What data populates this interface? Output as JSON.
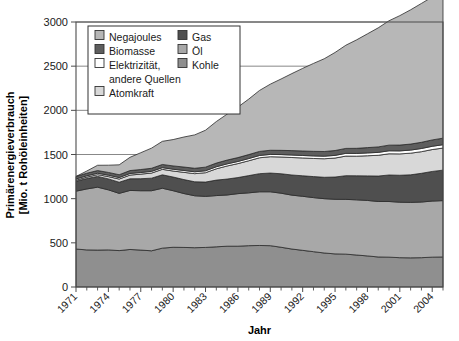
{
  "chart_data": {
    "type": "area",
    "stacked": true,
    "title": "",
    "xlabel": "Jahr",
    "ylabel": "Primärenergieverbrauch [Mio. t Rohöleinheiten]",
    "ylabel_line1": "Primärenergieverbrauch",
    "ylabel_line2": "[Mio. t Rohöleinheiten]",
    "ylim": [
      0,
      3000
    ],
    "ytick_values": [
      0,
      500,
      1000,
      1500,
      2000,
      2500,
      3000
    ],
    "ytick_labels": [
      "0",
      "500",
      "1000",
      "1500",
      "2000",
      "2500",
      "3000"
    ],
    "grid": "horizontal-major",
    "legend_position": "top-left-inside",
    "x": [
      1971,
      1972,
      1973,
      1974,
      1975,
      1976,
      1977,
      1978,
      1979,
      1980,
      1981,
      1982,
      1983,
      1984,
      1985,
      1986,
      1987,
      1988,
      1989,
      1990,
      1991,
      1992,
      1993,
      1994,
      1995,
      1996,
      1997,
      1998,
      1999,
      2000,
      2001,
      2002,
      2003,
      2004,
      2005
    ],
    "xtick_labels": [
      "1971",
      "1974",
      "1977",
      "1980",
      "1983",
      "1986",
      "1989",
      "1992",
      "1995",
      "1998",
      "2001",
      "2004"
    ],
    "xtick_values": [
      1971,
      1974,
      1977,
      1980,
      1983,
      1986,
      1989,
      1992,
      1995,
      1998,
      2001,
      2004
    ],
    "xlim": [
      1971,
      2005
    ],
    "series": [
      {
        "name": "Kohle",
        "color": "#8f8f8f",
        "values": [
          430,
          420,
          418,
          420,
          412,
          425,
          418,
          410,
          440,
          450,
          448,
          445,
          448,
          455,
          462,
          462,
          468,
          470,
          468,
          450,
          430,
          415,
          400,
          385,
          375,
          372,
          362,
          352,
          340,
          338,
          332,
          330,
          332,
          338,
          340
        ]
      },
      {
        "name": "Öl",
        "color": "#a8a8a8",
        "values": [
          655,
          690,
          712,
          680,
          648,
          668,
          672,
          680,
          678,
          640,
          610,
          588,
          578,
          580,
          580,
          595,
          598,
          608,
          610,
          612,
          610,
          612,
          612,
          615,
          618,
          620,
          625,
          628,
          628,
          630,
          628,
          628,
          630,
          635,
          638
        ]
      },
      {
        "name": "Gas",
        "color": "#4f4f4f",
        "values": [
          112,
          118,
          122,
          124,
          126,
          132,
          136,
          142,
          152,
          155,
          158,
          158,
          162,
          175,
          180,
          182,
          195,
          205,
          212,
          220,
          228,
          232,
          238,
          242,
          252,
          268,
          272,
          278,
          288,
          300,
          305,
          312,
          325,
          335,
          345
        ]
      },
      {
        "name": "Atomkraft",
        "color": "#d8d8d8",
        "values": [
          12,
          16,
          20,
          26,
          36,
          42,
          52,
          58,
          62,
          68,
          82,
          92,
          106,
          128,
          148,
          158,
          168,
          180,
          185,
          190,
          198,
          202,
          205,
          210,
          215,
          222,
          222,
          228,
          235,
          240,
          242,
          245,
          245,
          248,
          250
        ]
      },
      {
        "name": "Elektrizität, andere Quellen",
        "color": "#ffffff",
        "values": [
          14,
          15,
          16,
          16,
          17,
          18,
          18,
          19,
          19,
          20,
          21,
          21,
          22,
          23,
          24,
          24,
          25,
          26,
          26,
          27,
          28,
          28,
          29,
          29,
          30,
          31,
          31,
          32,
          33,
          34,
          34,
          35,
          36,
          37,
          38
        ]
      },
      {
        "name": "Biomasse",
        "color": "#5e5e5e",
        "values": [
          28,
          29,
          30,
          31,
          32,
          33,
          34,
          35,
          36,
          38,
          39,
          40,
          41,
          42,
          43,
          44,
          45,
          46,
          47,
          48,
          50,
          51,
          52,
          53,
          55,
          56,
          58,
          60,
          62,
          64,
          66,
          68,
          70,
          72,
          74
        ]
      },
      {
        "name": "Negajoules",
        "color": "#b7b7b7",
        "values": [
          0,
          25,
          60,
          82,
          112,
          150,
          190,
          228,
          262,
          298,
          340,
          378,
          418,
          470,
          520,
          572,
          628,
          690,
          748,
          808,
          872,
          935,
          995,
          1050,
          1110,
          1168,
          1228,
          1288,
          1348,
          1408,
          1465,
          1520,
          1572,
          1618,
          1655
        ]
      }
    ],
    "stack_order_bottom_to_top": [
      "Kohle",
      "Öl",
      "Gas",
      "Atomkraft",
      "Elektrizität, andere Quellen",
      "Biomasse",
      "Negajoules"
    ],
    "legend": {
      "entries": [
        {
          "label": "Negajoules",
          "color": "#b7b7b7",
          "column": 1
        },
        {
          "label": "Biomasse",
          "color": "#5e5e5e",
          "column": 1
        },
        {
          "label": "Elektrizität,",
          "label2": "andere Quellen",
          "color": "#ffffff",
          "column": 1
        },
        {
          "label": "Atomkraft",
          "color": "#d8d8d8",
          "column": 1
        },
        {
          "label": "Gas",
          "color": "#4f4f4f",
          "column": 2
        },
        {
          "label": "Öl",
          "color": "#a8a8a8",
          "column": 2
        },
        {
          "label": "Kohle",
          "color": "#8f8f8f",
          "column": 2
        }
      ]
    }
  }
}
